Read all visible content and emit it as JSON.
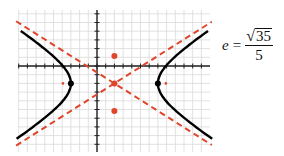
{
  "equation": {
    "lhs": "e",
    "equals": "=",
    "numerator_radical": "√",
    "numerator_radicand": "35",
    "denominator": "5"
  },
  "colors": {
    "grid": "#d9d9d9",
    "axis": "#222222",
    "curve": "#000000",
    "asymptote": "#e0452b",
    "point": "#e0452b"
  },
  "graph": {
    "center": [
      2,
      -2
    ],
    "a": 5,
    "b": 3.1623,
    "c": 5.9161,
    "vertices": [
      [
        -3,
        -2
      ],
      [
        7,
        -2
      ]
    ],
    "foci": [
      [
        -3.916,
        -2
      ],
      [
        7.916,
        -2
      ]
    ],
    "co_vertices": [
      [
        2,
        1.16
      ],
      [
        2,
        -5.16
      ]
    ],
    "x_range": [
      -9,
      13
    ],
    "y_range": [
      -10,
      6
    ]
  }
}
